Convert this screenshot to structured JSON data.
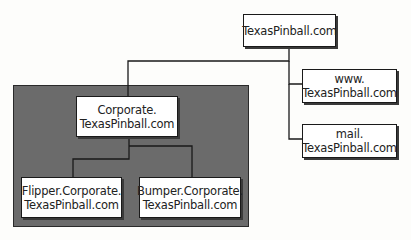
{
  "diagram": {
    "colors": {
      "zone_fill": "#6b6b6b",
      "box_fill": "#ffffff",
      "line": "#1a1a1a",
      "background": "#fdfdfb"
    },
    "nodes": {
      "root": {
        "lines": [
          "TexasPinball.com"
        ]
      },
      "www": {
        "lines": [
          "www.",
          "TexasPinball.com"
        ]
      },
      "mail": {
        "lines": [
          "mail.",
          "TexasPinball.com"
        ]
      },
      "corporate": {
        "lines": [
          "Corporate.",
          "TexasPinball.com"
        ]
      },
      "flipper": {
        "lines": [
          "Flipper.Corporate.",
          "TexasPinball.com"
        ]
      },
      "bumper": {
        "lines": [
          "Bumper.Corporate.",
          "TexasPinball.com"
        ]
      }
    },
    "edges": [
      {
        "from": "root",
        "to": "corporate"
      },
      {
        "from": "root",
        "to": "www"
      },
      {
        "from": "root",
        "to": "mail"
      },
      {
        "from": "corporate",
        "to": "flipper"
      },
      {
        "from": "corporate",
        "to": "bumper"
      }
    ],
    "zones": [
      {
        "name": "corporate-zone",
        "contains": [
          "corporate",
          "flipper",
          "bumper"
        ]
      }
    ]
  }
}
